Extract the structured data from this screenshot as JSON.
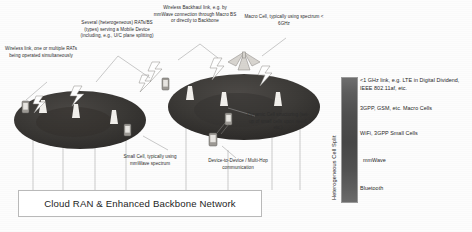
{
  "figure": {
    "background_color": "#fdfdfd"
  },
  "annotations": [
    {
      "id": "wireless-link",
      "text": "Wireless link, one or multiple RATs being operated simultaneously"
    },
    {
      "id": "several-rats",
      "text": "Several (heterogeneous) RATs/BS (types) serving a Mobile Device (including, e.g., U/C plane splitting)"
    },
    {
      "id": "wireless-backhaul",
      "text": "Wireless Backhaul link, e.g. by mmWave connection through Macro BS or directly to Backbone"
    },
    {
      "id": "macro-cell",
      "text": "Macro Cell, typically using spectrum < 6GHz"
    },
    {
      "id": "dynamic-cell",
      "text": "Dynamic Cell structuring (set-up of small cells upon need, etc.)"
    },
    {
      "id": "small-cell",
      "text": "Small Cell, typically using mmWave spectrum"
    },
    {
      "id": "device-to-device",
      "text": "Device-to-Device / Multi-Hop communication"
    }
  ],
  "cloud_ran": {
    "label": "Cloud RAN & Enhanced Backbone Network"
  },
  "legend": {
    "axis_title": "Heterogeneous Cell Split",
    "gradient_top_color": "#6e6e6e",
    "gradient_bottom_color": "#6b6b6b",
    "entries": [
      {
        "id": "sub1ghz",
        "text": "<1 GHz link, e.g. LTE in Digital Dividend, IEEE 802.11af, etc."
      },
      {
        "id": "macro",
        "text": "3GPP, GSM, etc. Macro Cells"
      },
      {
        "id": "smallcells",
        "text": "WiFi, 3GPP Small Cells"
      },
      {
        "id": "mmwave",
        "text": "mmWave"
      },
      {
        "id": "bluetooth",
        "text": "Bluetooth"
      }
    ]
  },
  "cells": {
    "left_cell_name": "small-cell-coverage-ellipse",
    "right_cell_name": "macro-cell-coverage-ellipse",
    "ellipse_fill": "#3c3a38"
  }
}
